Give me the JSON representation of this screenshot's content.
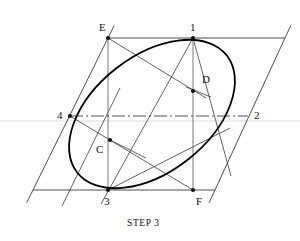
{
  "figure": {
    "title": "STEP 3",
    "colors": {
      "ink": "#1a1a1a",
      "construction": "#555555",
      "curve": "#000000",
      "background": "#ffffff",
      "faint_guide": "#cfcfcf"
    },
    "viewbox": {
      "width": 300,
      "height": 241
    },
    "points": [
      {
        "id": "E",
        "label": "E",
        "x": 108,
        "y": 38,
        "dot": true,
        "label_x": 99,
        "label_y": 22
      },
      {
        "id": "1",
        "label": "1",
        "x": 193,
        "y": 38,
        "dot": true,
        "label_x": 190,
        "label_y": 22
      },
      {
        "id": "4",
        "label": "4",
        "x": 70,
        "y": 116,
        "dot": true,
        "label_x": 57,
        "label_y": 110
      },
      {
        "id": "2",
        "label": "2",
        "x": 248,
        "y": 116,
        "dot": false,
        "label_x": 254,
        "label_y": 110
      },
      {
        "id": "3",
        "label": "3",
        "x": 108,
        "y": 190,
        "dot": true,
        "label_x": 104,
        "label_y": 196
      },
      {
        "id": "F",
        "label": "F",
        "x": 193,
        "y": 190,
        "dot": true,
        "label_x": 196,
        "label_y": 196
      },
      {
        "id": "C",
        "label": "C",
        "x": 110,
        "y": 140,
        "dot": true,
        "label_x": 96,
        "label_y": 144
      },
      {
        "id": "D",
        "label": "D",
        "x": 193,
        "y": 91,
        "dot": true,
        "label_x": 202,
        "label_y": 74
      }
    ],
    "parallelogram": {
      "name": "enclosing-parallelogram",
      "corners": [
        {
          "x": 33,
          "y": 190
        },
        {
          "x": 108,
          "y": 38
        },
        {
          "x": 285,
          "y": 38
        },
        {
          "x": 215,
          "y": 190
        }
      ]
    },
    "center_line": {
      "from": {
        "x": 70,
        "y": 116
      },
      "to": {
        "x": 248,
        "y": 116
      }
    },
    "vertical_lines": [
      {
        "from": {
          "x": 108,
          "y": 38
        },
        "to": {
          "x": 108,
          "y": 190
        }
      },
      {
        "from": {
          "x": 193,
          "y": 38
        },
        "to": {
          "x": 193,
          "y": 190
        }
      }
    ],
    "construction_lines": [
      {
        "name": "line-E-to-3-extended",
        "from": {
          "x": 62,
          "y": 206
        },
        "to": {
          "x": 120,
          "y": 88
        }
      },
      {
        "name": "line-E-through-D",
        "from": {
          "x": 108,
          "y": 38
        },
        "to": {
          "x": 206,
          "y": 98
        }
      },
      {
        "name": "line-F-through-C",
        "from": {
          "x": 193,
          "y": 190
        },
        "to": {
          "x": 70,
          "y": 116
        }
      },
      {
        "name": "line-1-to-3",
        "from": {
          "x": 193,
          "y": 38
        },
        "to": {
          "x": 101,
          "y": 204
        }
      },
      {
        "name": "line-1-to-F-right",
        "from": {
          "x": 193,
          "y": 38
        },
        "to": {
          "x": 231,
          "y": 176
        }
      },
      {
        "name": "line-3-to-2-diagonal",
        "from": {
          "x": 108,
          "y": 190
        },
        "to": {
          "x": 230,
          "y": 128
        }
      },
      {
        "name": "radius-mark-at-D",
        "from": {
          "x": 186,
          "y": 87
        },
        "to": {
          "x": 211,
          "y": 97
        }
      },
      {
        "name": "radius-mark-at-C",
        "from": {
          "x": 110,
          "y": 140
        },
        "to": {
          "x": 146,
          "y": 158
        }
      }
    ],
    "ellipse": {
      "name": "approximate-ellipse",
      "center": {
        "x": 152,
        "y": 114
      },
      "semi_major": 95,
      "semi_minor": 58,
      "rotation_deg": -38,
      "tangent_points": [
        "1",
        "2",
        "3",
        "4"
      ],
      "arc_centers": [
        "C",
        "D"
      ]
    }
  }
}
